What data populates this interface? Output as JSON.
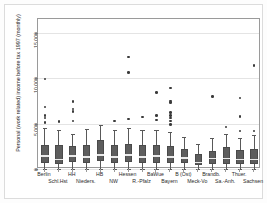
{
  "chart_data": {
    "type": "box",
    "title": "",
    "xlabel": "",
    "ylabel": "Personal (work related) income before tax 1997 (monthly)",
    "ylim": [
      0,
      16500
    ],
    "yticks": [
      0,
      5000,
      10000,
      15000
    ],
    "ytick_labels": [
      "0",
      "5,000",
      "10,000",
      "15,000"
    ],
    "grid": true,
    "legend": "none",
    "categories": [
      "Berlin",
      "Schl.Hst",
      "HH",
      "Nieders.",
      "HB",
      "NW",
      "Hessen",
      "R.-Pfalz",
      "BaWue",
      "Bayern",
      "B (Ost)",
      "Meck-Vo",
      "Brandb.",
      "Sa.-Anh.",
      "Thuer.",
      "Sachsen"
    ],
    "category_rows": [
      0,
      1,
      0,
      1,
      0,
      1,
      0,
      1,
      0,
      1,
      0,
      1,
      0,
      1,
      0,
      1
    ],
    "boxes": [
      {
        "category": "Berlin",
        "whisker_low": 0,
        "q1": 700,
        "median": 1500,
        "q3": 2600,
        "whisker_high": 4500,
        "outliers": [
          5100,
          5600,
          5900,
          6800,
          9900
        ]
      },
      {
        "category": "Schl.Hst",
        "whisker_low": 0,
        "q1": 600,
        "median": 1100,
        "q3": 2600,
        "whisker_high": 4300,
        "outliers": [
          5200
        ]
      },
      {
        "category": "HH",
        "whisker_low": 0,
        "q1": 800,
        "median": 1500,
        "q3": 2500,
        "whisker_high": 3900,
        "outliers": [
          5300,
          6300,
          6600,
          7400
        ]
      },
      {
        "category": "Nieders.",
        "whisker_low": 0,
        "q1": 700,
        "median": 1400,
        "q3": 2600,
        "whisker_high": 4400,
        "outliers": []
      },
      {
        "category": "HB",
        "whisker_low": 0,
        "q1": 900,
        "median": 1600,
        "q3": 3200,
        "whisker_high": 4800,
        "outliers": []
      },
      {
        "category": "NW",
        "whisker_low": 0,
        "q1": 700,
        "median": 1400,
        "q3": 2600,
        "whisker_high": 4300,
        "outliers": [
          5300
        ]
      },
      {
        "category": "Hessen",
        "whisker_low": 0,
        "q1": 800,
        "median": 1600,
        "q3": 2800,
        "whisker_high": 4500,
        "outliers": [
          5500,
          10600,
          12300
        ]
      },
      {
        "category": "R.-Pfalz",
        "whisker_low": 0,
        "q1": 700,
        "median": 1400,
        "q3": 2600,
        "whisker_high": 4300,
        "outliers": [
          5700
        ]
      },
      {
        "category": "BaWue",
        "whisker_low": 0,
        "q1": 700,
        "median": 1500,
        "q3": 2600,
        "whisker_high": 4300,
        "outliers": [
          5400,
          5900,
          8400
        ]
      },
      {
        "category": "Bayern",
        "whisker_low": 0,
        "q1": 700,
        "median": 1400,
        "q3": 2500,
        "whisker_high": 4100,
        "outliers": [
          4900,
          5300,
          5600,
          5900,
          6200,
          7300,
          7500,
          8900
        ]
      },
      {
        "category": "B (Ost)",
        "whisker_low": 0,
        "q1": 700,
        "median": 1300,
        "q3": 2200,
        "whisker_high": 3500,
        "outliers": []
      },
      {
        "category": "Meck-Vo",
        "whisker_low": 0,
        "q1": 400,
        "median": 800,
        "q3": 1700,
        "whisker_high": 2800,
        "outliers": []
      },
      {
        "category": "Brandb.",
        "whisker_low": 0,
        "q1": 600,
        "median": 1200,
        "q3": 2000,
        "whisker_high": 3400,
        "outliers": [
          8000
        ]
      },
      {
        "category": "Sa.-Anh.",
        "whisker_low": 0,
        "q1": 600,
        "median": 1200,
        "q3": 2400,
        "whisker_high": 3800,
        "outliers": [
          4600
        ]
      },
      {
        "category": "Thuer.",
        "whisker_low": 0,
        "q1": 600,
        "median": 1100,
        "q3": 2100,
        "whisker_high": 3400,
        "outliers": [
          4200,
          5800,
          7800
        ]
      },
      {
        "category": "Sachsen",
        "whisker_low": 0,
        "q1": 600,
        "median": 1100,
        "q3": 2200,
        "whisker_high": 3700,
        "outliers": [
          4200,
          11400
        ]
      }
    ],
    "colors": {
      "box_fill": "#5d5d5d",
      "box_edge": "#4a4a4a",
      "median": "#eaeaea",
      "whisker": "#595959",
      "outlier": "#3a3a3a",
      "grid": "#e4e4e4",
      "axis": "#9a9a9a",
      "background": "#ffffff"
    }
  }
}
